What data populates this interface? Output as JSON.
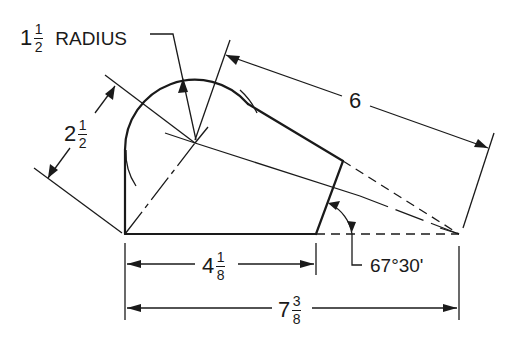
{
  "drawing": {
    "type": "technical-dimensioned-drawing",
    "stroke_color": "#1a1a1a",
    "background": "#ffffff"
  },
  "dimensions": {
    "radius": {
      "whole": "1",
      "num": "1",
      "den": "2",
      "suffix": "RADIUS"
    },
    "slant_height": {
      "whole": "2",
      "num": "1",
      "den": "2"
    },
    "top_length": {
      "whole": "6"
    },
    "base_length": {
      "whole": "4",
      "num": "1",
      "den": "8"
    },
    "overall_length": {
      "whole": "7",
      "num": "3",
      "den": "8"
    },
    "angle": {
      "text": "67°30'"
    }
  }
}
